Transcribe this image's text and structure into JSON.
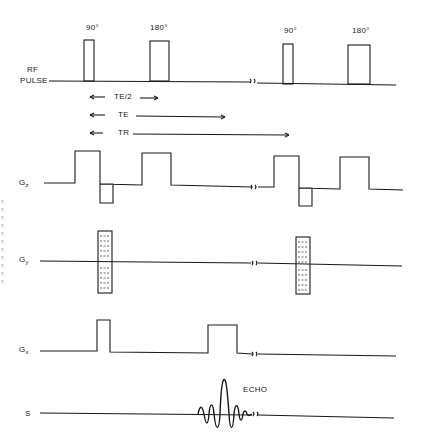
{
  "rows": {
    "rf": {
      "label_line1": "RF",
      "label_line2": "PULSE"
    },
    "gz": {
      "label": "G",
      "sub": "z"
    },
    "gy": {
      "label": "G",
      "sub": "y"
    },
    "gx": {
      "label": "G",
      "sub": "x"
    },
    "s": {
      "label": "S"
    }
  },
  "pulse_labels": {
    "first_90": "90°",
    "first_180": "180°",
    "second_90": "90°",
    "second_180": "180°"
  },
  "timing_intervals": [
    {
      "label": "TE/2"
    },
    {
      "label": "TE"
    },
    {
      "label": "TR"
    }
  ],
  "echo_label": "ECHO",
  "colors": {
    "stroke": "#1a1a1a",
    "background": "#ffffff"
  }
}
